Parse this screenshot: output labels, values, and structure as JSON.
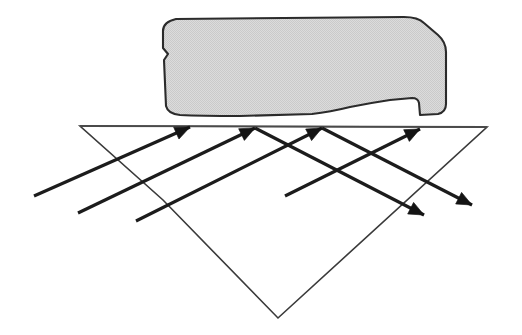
{
  "figure": {
    "domain": "physics-optics-diagram",
    "canvas": {
      "width": 522,
      "height": 335,
      "background": "#ffffff"
    },
    "caption": ""
  },
  "colors": {
    "background": "#ffffff",
    "blob_fill": "#d5d5d5",
    "blob_stroke": "#2b2b2b",
    "ray_stroke": "#1c1c1c",
    "arrow_fill": "#141414",
    "plane_stroke": "#3a3a3a",
    "surface_stroke": "#4a4a4a"
  },
  "material_block": {
    "name": "irregular-gray-material-block",
    "description": "Rough-edged gray slab resting above the reflecting surface",
    "fill": "#d5d5d5",
    "stroke": "#2b2b2b",
    "path": "M 176 19 L 404 17 Q 418 17 424 23 L 438 35 Q 446 42 446 52 L 446 104 Q 446 112 438 114 L 420 115 L 419 103 Q 418 98 412 98 L 390 100 Q 370 103 350 107 Q 330 112 312 114 L 240 116 Q 200 116 180 115 Q 168 114 166 106 L 164 60 L 168 54 L 163 48 L 163 31 Q 163 22 176 19 Z",
    "bottom_contour_note": "wavy underside: dips at left, bumps up near center, slopes down to right notch"
  },
  "reflecting_surface": {
    "name": "smooth-reflecting-surface-line",
    "description": "Horizontal boundary line where rays strike and reflect",
    "x1": 80,
    "y1": 126,
    "x2": 487,
    "y2": 127
  },
  "plane": {
    "name": "perspective-ground-plane",
    "description": "Parallelogram drawn in perspective representing the flat surface",
    "vertices": [
      {
        "x": 80,
        "y": 126
      },
      {
        "x": 487,
        "y": 127
      },
      {
        "x": 278,
        "y": 318
      },
      {
        "x": 163,
        "y": 200
      }
    ]
  },
  "incident_rays": {
    "label": "Incident parallel rays",
    "direction": "up and to the right",
    "count": 4,
    "rays": [
      {
        "id": "incident-ray-1",
        "tail_x": 34,
        "tail_y": 196,
        "tip_x": 190,
        "tip_y": 127
      },
      {
        "id": "incident-ray-2",
        "tail_x": 78,
        "tail_y": 213,
        "tip_x": 255,
        "tip_y": 128
      },
      {
        "id": "incident-ray-3",
        "tail_x": 136,
        "tail_y": 221,
        "tip_x": 322,
        "tip_y": 128
      },
      {
        "id": "incident-ray-4",
        "tail_x": 285,
        "tail_y": 196,
        "tip_x": 420,
        "tip_y": 129
      }
    ]
  },
  "reflected_rays": {
    "label": "Reflected parallel rays",
    "direction": "down and to the right",
    "count": 2,
    "rays": [
      {
        "id": "reflected-ray-1",
        "tail_x": 255,
        "tail_y": 128,
        "tip_x": 424,
        "tip_y": 215
      },
      {
        "id": "reflected-ray-2",
        "tail_x": 322,
        "tail_y": 128,
        "tip_x": 472,
        "tip_y": 205
      }
    ]
  },
  "arrowheads": [
    {
      "id": "arrowhead-incident-1",
      "x": 190,
      "y": 127,
      "angle_deg": -24
    },
    {
      "id": "arrowhead-incident-2",
      "x": 255,
      "y": 128,
      "angle_deg": -26
    },
    {
      "id": "arrowhead-incident-3",
      "x": 322,
      "y": 128,
      "angle_deg": -27
    },
    {
      "id": "arrowhead-incident-4",
      "x": 420,
      "y": 129,
      "angle_deg": -26
    },
    {
      "id": "arrowhead-reflected-1",
      "x": 424,
      "y": 215,
      "angle_deg": 27
    },
    {
      "id": "arrowhead-reflected-2",
      "x": 472,
      "y": 205,
      "angle_deg": 27
    }
  ]
}
